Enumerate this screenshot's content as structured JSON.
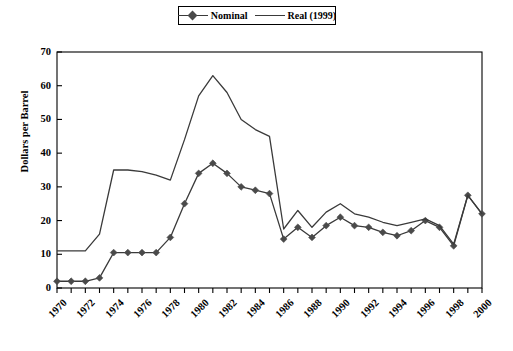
{
  "legend": {
    "position": "top-center",
    "entries": [
      {
        "label": "Nominal",
        "marker": "diamond",
        "line": true
      },
      {
        "label": "Real (1999)",
        "marker": "none",
        "line": true
      }
    ]
  },
  "axes": {
    "ylabel": "Dollars per Barrel",
    "xlabel": "",
    "y_ticks": [
      0,
      10,
      20,
      30,
      40,
      50,
      60,
      70
    ],
    "x_tick_labels": [
      "1970",
      "1972",
      "1974",
      "1976",
      "1978",
      "1980",
      "1982",
      "1984",
      "1986",
      "1988",
      "1990",
      "1992",
      "1994",
      "1996",
      "1998",
      "2000"
    ]
  },
  "colors": {
    "line": "#3a3a3a",
    "marker": "#4a4a4a",
    "axis": "#000000",
    "background": "#ffffff"
  },
  "chart_data": {
    "type": "line",
    "title": "",
    "xlabel": "",
    "ylabel": "Dollars per Barrel",
    "xlim": [
      1970,
      2000
    ],
    "ylim": [
      0,
      70
    ],
    "grid": false,
    "legend_position": "top-center",
    "x": [
      1970,
      1971,
      1972,
      1973,
      1974,
      1975,
      1976,
      1977,
      1978,
      1979,
      1980,
      1981,
      1982,
      1983,
      1984,
      1985,
      1986,
      1987,
      1988,
      1989,
      1990,
      1991,
      1992,
      1993,
      1994,
      1995,
      1996,
      1997,
      1998,
      1999,
      2000
    ],
    "series": [
      {
        "name": "Nominal",
        "marker": "diamond",
        "values": [
          2.0,
          2.0,
          2.0,
          3.0,
          10.5,
          10.5,
          10.5,
          10.5,
          15.0,
          25.0,
          34.0,
          37.0,
          34.0,
          30.0,
          29.0,
          28.0,
          14.5,
          18.0,
          15.0,
          18.5,
          21.0,
          18.5,
          18.0,
          16.5,
          15.5,
          17.0,
          20.0,
          18.0,
          12.5,
          27.5,
          22.0
        ]
      },
      {
        "name": "Real (1999)",
        "marker": "none",
        "values": [
          11.0,
          11.0,
          11.0,
          16.0,
          35.0,
          35.0,
          34.5,
          33.5,
          32.0,
          44.0,
          57.0,
          63.0,
          58.0,
          50.0,
          47.0,
          45.0,
          17.5,
          23.0,
          18.0,
          22.5,
          25.0,
          22.0,
          21.0,
          19.5,
          18.5,
          19.5,
          20.5,
          18.5,
          13.0,
          27.5,
          22.0
        ]
      }
    ]
  }
}
